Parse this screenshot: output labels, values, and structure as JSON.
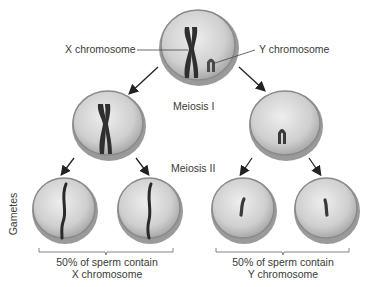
{
  "labels": {
    "x_chromosome": "X chromosome",
    "y_chromosome": "Y chromosome",
    "meiosis_1": "Meiosis I",
    "meiosis_2": "Meiosis II",
    "gametes": "Gametes",
    "x_sperm_line1": "50% of sperm contain",
    "x_sperm_line2": "X chromosome",
    "y_sperm_line1": "50% of sperm contain",
    "y_sperm_line2": "Y chromosome"
  },
  "colors": {
    "cell_fill": "#d6d6d6",
    "cell_edge": "#8a8a8a",
    "chromosome": "#2f2f2f",
    "arrow": "#222222"
  }
}
